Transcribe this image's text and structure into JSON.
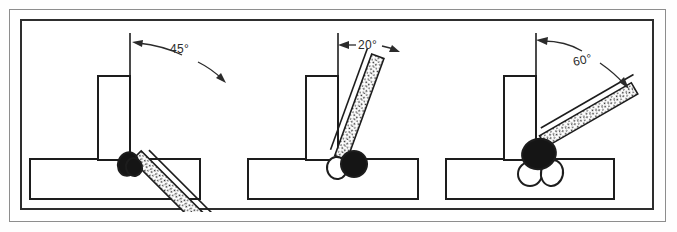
{
  "figure": {
    "background_color": "#ffffff",
    "outer_border_color": "#8d8d8d",
    "inner_border_color": "#2e2e2e",
    "line_color": "#1d1d1d",
    "bead_fill_dark": "#151515",
    "bead_fill_light": "#ffffff",
    "electrode_speckle_color": "#2a2a2a"
  },
  "panels": [
    {
      "id": "panel-45",
      "angle_label": "45°",
      "angle_value": 45,
      "electrode_tilt_from_vertical": 45,
      "bead_count": 2,
      "beads": [
        {
          "style": "dark",
          "label": "weld-bead-dark-1"
        },
        {
          "style": "dark",
          "label": "weld-bead-dark-2"
        }
      ],
      "parts": {
        "vertical_plate": "vertical-plate",
        "base_plate": "base-plate",
        "electrode": "electrode",
        "reference_line": "vertical-reference-line",
        "arrow": "angle-arrow"
      }
    },
    {
      "id": "panel-20",
      "angle_label": "20°",
      "angle_value": 20,
      "electrode_tilt_from_vertical": 20,
      "bead_count": 2,
      "beads": [
        {
          "style": "light",
          "label": "weld-bead-light-1"
        },
        {
          "style": "dark",
          "label": "weld-bead-dark-1"
        }
      ],
      "parts": {
        "vertical_plate": "vertical-plate",
        "base_plate": "base-plate",
        "electrode": "electrode",
        "reference_line": "vertical-reference-line",
        "arrow": "angle-arrow"
      }
    },
    {
      "id": "panel-60",
      "angle_label": "60°",
      "angle_value": 60,
      "electrode_tilt_from_vertical": 60,
      "bead_count": 3,
      "beads": [
        {
          "style": "light",
          "label": "weld-bead-light-1"
        },
        {
          "style": "light",
          "label": "weld-bead-light-2"
        },
        {
          "style": "dark",
          "label": "weld-bead-dark-1"
        }
      ],
      "parts": {
        "vertical_plate": "vertical-plate",
        "base_plate": "base-plate",
        "electrode": "electrode",
        "reference_line": "vertical-reference-line",
        "arrow": "angle-arrow"
      }
    }
  ]
}
